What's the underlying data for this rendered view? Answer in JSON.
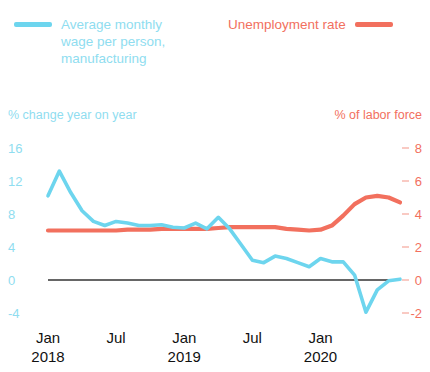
{
  "legend": {
    "series": [
      {
        "name": "wage-series",
        "label": "Average monthly wage per person, manufacturing",
        "color": "#6DD5EE",
        "swatch_position": "left"
      },
      {
        "name": "unemployment-series",
        "label": "Unemployment rate",
        "color": "#F2705E",
        "swatch_position": "right"
      }
    ]
  },
  "axes": {
    "left_caption": "% change year on year",
    "right_caption": "% of labor force",
    "left_ticks": [
      "16",
      "12",
      "8",
      "4",
      "0",
      "-4"
    ],
    "right_ticks": [
      "8",
      "6",
      "4",
      "2",
      "0",
      "-2"
    ],
    "x_ticks": [
      {
        "month": "Jan",
        "year": "2018"
      },
      {
        "month": "Jul",
        "year": ""
      },
      {
        "month": "Jan",
        "year": "2019"
      },
      {
        "month": "Jul",
        "year": ""
      },
      {
        "month": "Jan",
        "year": "2020"
      }
    ]
  },
  "chart_data": {
    "type": "line",
    "title": "",
    "subtitle": "",
    "xlabel": "",
    "ylabel": "% change year on year",
    "y2label": "% of labor force",
    "grid": false,
    "zero_line": true,
    "legend_position": "top",
    "ylim": [
      -4,
      16
    ],
    "y2lim": [
      -2,
      8
    ],
    "yticks": [
      -4,
      0,
      4,
      8,
      12,
      16
    ],
    "y2ticks": [
      -2,
      0,
      2,
      4,
      6,
      8
    ],
    "x": [
      "2018-01",
      "2018-02",
      "2018-03",
      "2018-04",
      "2018-05",
      "2018-06",
      "2018-07",
      "2018-08",
      "2018-09",
      "2018-10",
      "2018-11",
      "2018-12",
      "2019-01",
      "2019-02",
      "2019-03",
      "2019-04",
      "2019-05",
      "2019-06",
      "2019-07",
      "2019-08",
      "2019-09",
      "2019-10",
      "2019-11",
      "2019-12",
      "2020-01",
      "2020-02",
      "2020-03",
      "2020-04",
      "2020-05",
      "2020-06",
      "2020-07",
      "2020-08"
    ],
    "xtick_labels": [
      "Jan 2018",
      "Jul",
      "Jan 2019",
      "Jul",
      "Jan 2020"
    ],
    "xtick_indices": [
      0,
      6,
      12,
      18,
      24
    ],
    "series": [
      {
        "name": "Average monthly wage per person, manufacturing",
        "axis": "left",
        "color": "#6DD5EE",
        "unit": "% change year on year",
        "values": [
          10.2,
          13.2,
          10.6,
          8.4,
          7.1,
          6.6,
          7.1,
          6.9,
          6.6,
          6.6,
          6.7,
          6.4,
          6.3,
          6.9,
          6.2,
          7.6,
          6.2,
          4.3,
          2.4,
          2.1,
          2.9,
          2.6,
          2.1,
          1.6,
          2.6,
          2.2,
          2.2,
          0.6,
          -3.9,
          -1.2,
          -0.1,
          0.1
        ]
      },
      {
        "name": "Unemployment rate",
        "axis": "right",
        "color": "#F2705E",
        "unit": "% of labor force",
        "values": [
          3.0,
          3.0,
          3.0,
          3.0,
          3.0,
          3.0,
          3.0,
          3.05,
          3.05,
          3.05,
          3.1,
          3.1,
          3.1,
          3.1,
          3.1,
          3.15,
          3.2,
          3.2,
          3.2,
          3.2,
          3.2,
          3.1,
          3.05,
          3.0,
          3.05,
          3.3,
          3.9,
          4.6,
          5.0,
          5.1,
          5.0,
          4.7
        ]
      }
    ]
  }
}
